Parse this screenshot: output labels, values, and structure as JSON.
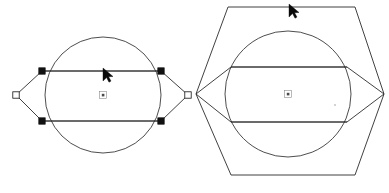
{
  "canvas": {
    "width": 389,
    "height": 193,
    "background_color": "#ffffff",
    "line_color": "#2b2b2b",
    "handle_fill_color": "#111111",
    "handle_hollow_color": "#ffffff",
    "cursor_color": "#0a0a0a",
    "description": "Two CAD-style wireframe line drawings side by side on a white background."
  },
  "figures": [
    {
      "id": "left-figure",
      "name": "lens-hexagon-with-inscribed-circle",
      "label": "",
      "center": {
        "x": 103,
        "y": 95
      },
      "circle": {
        "cx": 103,
        "cy": 95,
        "r": 58
      },
      "polygon_points": "16,95 42,71 161,71 188,95 161,121 42,121",
      "horizontal_lines": [
        {
          "x1": 42,
          "y1": 71,
          "x2": 161,
          "y2": 71
        },
        {
          "x1": 42,
          "y1": 121,
          "x2": 161,
          "y2": 121
        }
      ],
      "handles": [
        {
          "name": "vertex-handle-left",
          "x": 16,
          "y": 95,
          "style": "hollow"
        },
        {
          "name": "vertex-handle-top-left",
          "x": 42,
          "y": 71,
          "style": "filled"
        },
        {
          "name": "vertex-handle-top-right",
          "x": 161,
          "y": 71,
          "style": "filled"
        },
        {
          "name": "vertex-handle-right",
          "x": 188,
          "y": 95,
          "style": "hollow"
        },
        {
          "name": "vertex-handle-bottom-right",
          "x": 161,
          "y": 121,
          "style": "filled"
        },
        {
          "name": "vertex-handle-bottom-left",
          "x": 42,
          "y": 121,
          "style": "filled"
        }
      ],
      "center_marker": {
        "x": 103,
        "y": 95
      },
      "cursor": {
        "x": 104,
        "y": 70,
        "rotation": 0
      }
    },
    {
      "id": "right-figure",
      "name": "hexagon-with-inscribed-circle-and-lens",
      "label": "",
      "center": {
        "x": 288,
        "y": 94
      },
      "circle": {
        "cx": 288,
        "cy": 94,
        "r": 63
      },
      "outer_hexagon_points": "228,7 355,7 384,94 355,175 231,175 196,94",
      "inner_polygon_points": "196,94 231,67 347,67 384,94 347,122 231,122",
      "horizontal_lines": [
        {
          "x1": 231,
          "y1": 67,
          "x2": 347,
          "y2": 67
        },
        {
          "x1": 231,
          "y1": 122,
          "x2": 347,
          "y2": 122
        }
      ],
      "handles": [],
      "center_marker": {
        "x": 288,
        "y": 94
      },
      "faint_dot": {
        "x": 335,
        "y": 105
      },
      "cursor": {
        "x": 290,
        "y": 6,
        "rotation": 0
      }
    }
  ],
  "cursor_glyph": {
    "name": "mouse-pointer-arrow",
    "shape": "solid-triangular-arrowhead",
    "points": "0,0 0,13 3.6,9.6 6.0,14.2 8.0,13.1 5.6,8.7 10,8.5"
  }
}
